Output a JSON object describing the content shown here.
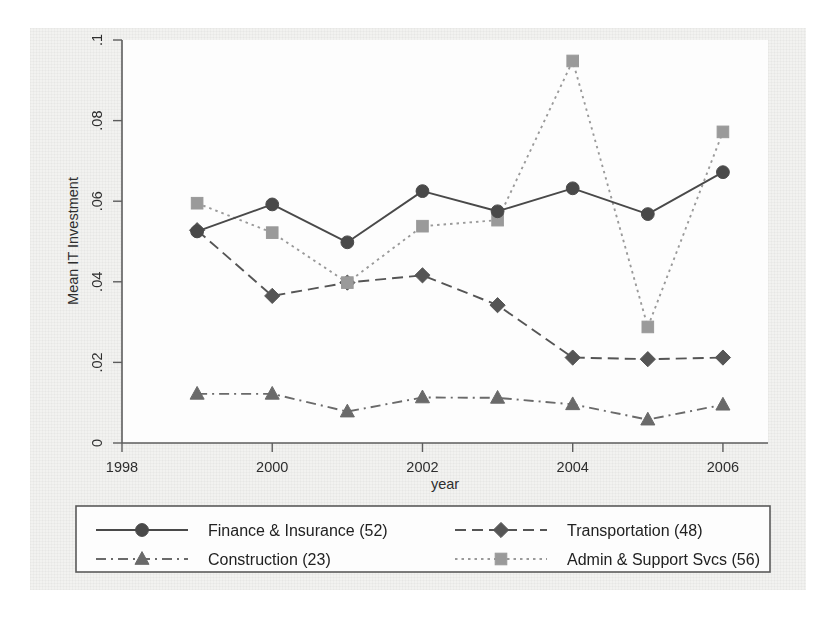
{
  "chart_data": {
    "type": "line",
    "title": "",
    "xlabel": "year",
    "ylabel": "Mean IT Investment",
    "x": [
      1999,
      2000,
      2001,
      2002,
      2003,
      2004,
      2005,
      2006
    ],
    "xlim": [
      1998,
      2006.6
    ],
    "ylim": [
      0,
      0.1
    ],
    "xticks": [
      1998,
      2000,
      2002,
      2004,
      2006
    ],
    "xticklabels": [
      "1998",
      "2000",
      "2002",
      "2004",
      "2006"
    ],
    "yticks": [
      0,
      0.02,
      0.04,
      0.06,
      0.08,
      0.1
    ],
    "yticklabels": [
      "0",
      ".02",
      ".04",
      ".06",
      ".08",
      ".1"
    ],
    "grid": false,
    "legend_position": "below",
    "series": [
      {
        "name": "Finance & Insurance (52)",
        "marker": "circle",
        "linestyle": "solid",
        "color": "#4a4a4a",
        "values": [
          0.0525,
          0.0592,
          0.0498,
          0.0625,
          0.0575,
          0.0632,
          0.0568,
          0.0672
        ]
      },
      {
        "name": "Transportation (48)",
        "marker": "diamond",
        "linestyle": "dashed",
        "color": "#555555",
        "values": [
          0.0528,
          0.0365,
          0.0398,
          0.0416,
          0.0342,
          0.0212,
          0.0208,
          0.0212
        ]
      },
      {
        "name": "Construction (23)",
        "marker": "triangle",
        "linestyle": "dashdot",
        "color": "#6a6a6a",
        "values": [
          0.0122,
          0.0122,
          0.0078,
          0.0113,
          0.0112,
          0.0096,
          0.0058,
          0.0095
        ]
      },
      {
        "name": "Admin & Support Svcs (56)",
        "marker": "square",
        "linestyle": "dotted",
        "color": "#9a9a9a",
        "values": [
          0.0595,
          0.0522,
          0.0398,
          0.0538,
          0.0553,
          0.0948,
          0.0288,
          0.0772
        ]
      }
    ]
  },
  "legend": {
    "entries": [
      {
        "label": "Finance & Insurance (52)",
        "marker": "circle",
        "linestyle": "solid"
      },
      {
        "label": "Transportation (48)",
        "marker": "diamond",
        "linestyle": "dashed"
      },
      {
        "label": "Construction (23)",
        "marker": "triangle",
        "linestyle": "dashdot"
      },
      {
        "label": "Admin & Support Svcs (56)",
        "marker": "square",
        "linestyle": "dotted"
      }
    ]
  },
  "colors": {
    "axis": "#5d5d5d",
    "text": "#2e2e2e",
    "plot_background": "#fdfdfd",
    "page_background": "#f2f2f0"
  }
}
